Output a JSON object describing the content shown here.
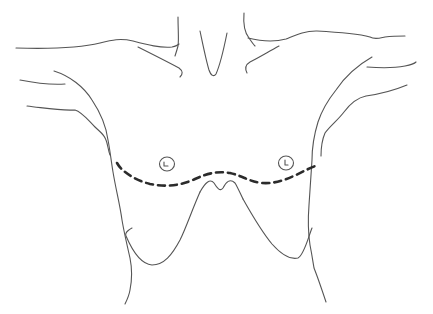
{
  "diagram": {
    "colors": {
      "background": "#ffffff",
      "outline": "#555555",
      "incision": "#2b2b2b"
    },
    "stroke_widths": {
      "outline": 1.1,
      "incision": 2.6
    },
    "incision_dash": "7 5",
    "elements": [
      {
        "name": "neck-left-contour"
      },
      {
        "name": "neck-right-contour"
      },
      {
        "name": "throat-notch"
      },
      {
        "name": "shoulder-left"
      },
      {
        "name": "shoulder-right"
      },
      {
        "name": "clavicle-left"
      },
      {
        "name": "clavicle-right"
      },
      {
        "name": "arm-left-upper"
      },
      {
        "name": "arm-left-lower"
      },
      {
        "name": "arm-right-upper"
      },
      {
        "name": "arm-right-lower"
      },
      {
        "name": "torso-left-side"
      },
      {
        "name": "torso-right-side"
      },
      {
        "name": "nipple-left"
      },
      {
        "name": "nipple-right"
      },
      {
        "name": "inframammary-incision-line"
      },
      {
        "name": "breast-left-fold"
      },
      {
        "name": "breast-right-fold"
      },
      {
        "name": "xiphoid-contour"
      }
    ]
  }
}
